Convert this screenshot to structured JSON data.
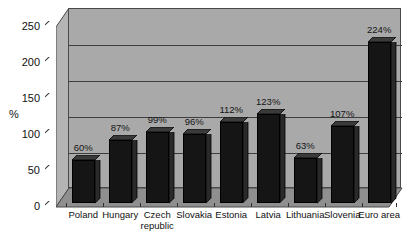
{
  "chart_data": {
    "type": "bar",
    "title": "",
    "xlabel": "",
    "ylabel": "%",
    "ylim": [
      0,
      250
    ],
    "ytick_labels": [
      "0",
      "50",
      "100",
      "150",
      "200",
      "250"
    ],
    "ytick_values": [
      0,
      50,
      100,
      150,
      200,
      250
    ],
    "grid": true,
    "legend": "none",
    "categories": [
      "Poland",
      "Hungary",
      "Czech republic",
      "Slovakia",
      "Estonia",
      "Latvia",
      "Lithuania",
      "Slovenia",
      "Euro area"
    ],
    "category_lines": [
      [
        "Poland"
      ],
      [
        "Hungary"
      ],
      [
        "Czech",
        "republic"
      ],
      [
        "Slovakia"
      ],
      [
        "Estonia"
      ],
      [
        "Latvia"
      ],
      [
        "Lithuania"
      ],
      [
        "Slovenia"
      ],
      [
        "Euro area"
      ]
    ],
    "values": [
      60,
      87,
      99,
      96,
      112,
      123,
      63,
      107,
      224
    ],
    "data_labels": [
      "60%",
      "87%",
      "99%",
      "96%",
      "112%",
      "123%",
      "63%",
      "107%",
      "224%"
    ],
    "colors": {
      "bar_front": "#151515",
      "bar_top": "#3a3a3a",
      "bar_side": "#2a2a2a",
      "plot_back_wall": "#a9a9a9",
      "plot_left_wall": "#b4b4b4",
      "plot_floor": "#8f8f8f",
      "gridline": "#3d3d3d",
      "axis_line": "#2b2b2b",
      "text": "#111111",
      "page_background": "#ffffff"
    }
  }
}
